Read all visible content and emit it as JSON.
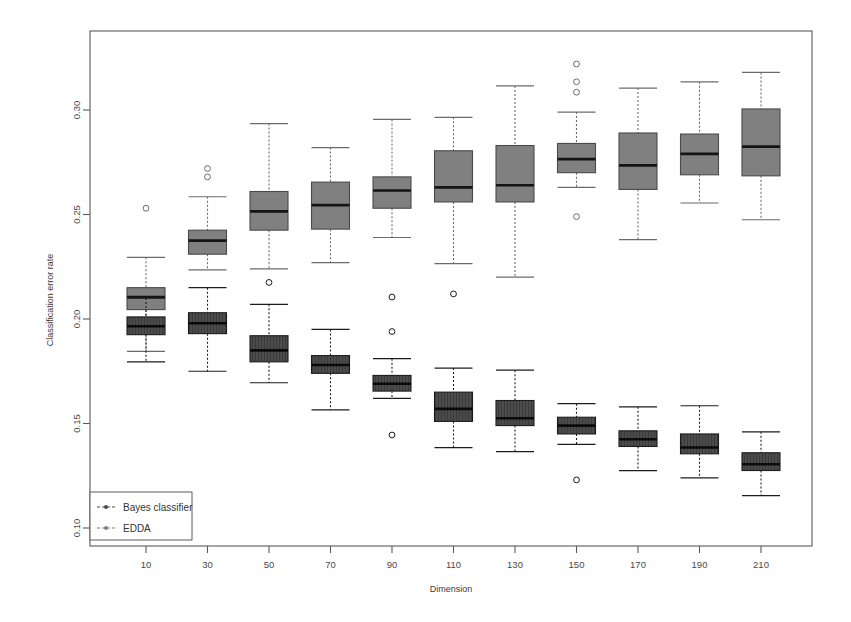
{
  "figure": {
    "width": 851,
    "height": 622,
    "background": "#ffffff"
  },
  "plot_frame": {
    "left": 90,
    "right": 812,
    "top": 31,
    "bottom": 546,
    "stroke": "#5a5a5a"
  },
  "axes": {
    "y_label": "Classification error rate",
    "x_label": "Dimension",
    "y_ticks": [
      {
        "value": 0.3,
        "label": "0.30"
      },
      {
        "value": 0.25,
        "label": "0.25"
      },
      {
        "value": 0.2,
        "label": "0.20"
      },
      {
        "value": 0.15,
        "label": "0.15"
      },
      {
        "value": 0.1,
        "label": "0.10"
      }
    ],
    "y_pixel_at_030": 110,
    "y_pixel_per_unit": 2090,
    "x_ticks": [
      "10",
      "30",
      "50",
      "70",
      "90",
      "110",
      "130",
      "150",
      "170",
      "190",
      "210"
    ],
    "x_first_center": 146,
    "x_spacing": 61.5,
    "grid": false
  },
  "legend": {
    "position": "bottom-left",
    "x": 90,
    "y": 492,
    "width": 102,
    "height": 48,
    "entries": [
      {
        "label": "Bayes classifier",
        "color": "#4c4c4c",
        "marker": "dashed-line-with-dot"
      },
      {
        "label": "EDDA",
        "color": "#808080",
        "marker": "dashed-line-with-dot"
      }
    ]
  },
  "series_style": {
    "bayes": {
      "name": "Bayes classifier",
      "fill": "#4c4c4c",
      "stroke": "#1c1c1c",
      "median_stroke": "#0a0a0a",
      "whisker_stroke": "#1c1c1c",
      "outlier_stroke": "#1c1c1c",
      "hatch": "vertical"
    },
    "edda": {
      "name": "EDDA",
      "fill": "#808080",
      "stroke": "#4a4a4a",
      "median_stroke": "#141414",
      "whisker_stroke": "#6b6b6b",
      "outlier_stroke": "#6b6b6b",
      "hatch": "none"
    }
  },
  "chart_data": {
    "type": "box",
    "title": "",
    "subtitle": "",
    "xlabel": "Dimension",
    "ylabel": "Classification error rate",
    "ylim": [
      0.095,
      0.327
    ],
    "categories": [
      10,
      30,
      50,
      70,
      90,
      110,
      130,
      150,
      170,
      190,
      210
    ],
    "legend": [
      "Bayes classifier",
      "EDDA"
    ],
    "legend_position": "bottom-left",
    "grid": false,
    "box_width_px": 38,
    "series": [
      {
        "name": "EDDA",
        "key": "edda",
        "color": "#808080",
        "boxes": [
          {
            "category": 10,
            "whisker_low": 0.1845,
            "q1": 0.2045,
            "median": 0.2105,
            "q3": 0.215,
            "whisker_high": 0.2295,
            "outliers": [
              0.253
            ]
          },
          {
            "category": 30,
            "whisker_low": 0.2235,
            "q1": 0.231,
            "median": 0.2375,
            "q3": 0.2425,
            "whisker_high": 0.2585,
            "outliers": [
              0.272,
              0.268
            ]
          },
          {
            "category": 50,
            "whisker_low": 0.224,
            "q1": 0.2425,
            "median": 0.2515,
            "q3": 0.261,
            "whisker_high": 0.2935,
            "outliers": []
          },
          {
            "category": 70,
            "whisker_low": 0.227,
            "q1": 0.243,
            "median": 0.2545,
            "q3": 0.2655,
            "whisker_high": 0.282,
            "outliers": []
          },
          {
            "category": 90,
            "whisker_low": 0.239,
            "q1": 0.253,
            "median": 0.2615,
            "q3": 0.268,
            "whisker_high": 0.2955,
            "outliers": []
          },
          {
            "category": 110,
            "whisker_low": 0.2265,
            "q1": 0.256,
            "median": 0.263,
            "q3": 0.2805,
            "whisker_high": 0.2965,
            "outliers": []
          },
          {
            "category": 130,
            "whisker_low": 0.22,
            "q1": 0.256,
            "median": 0.264,
            "q3": 0.283,
            "whisker_high": 0.3115,
            "outliers": []
          },
          {
            "category": 150,
            "whisker_low": 0.263,
            "q1": 0.27,
            "median": 0.2765,
            "q3": 0.284,
            "whisker_high": 0.299,
            "outliers": [
              0.322,
              0.3135,
              0.3085,
              0.249
            ]
          },
          {
            "category": 170,
            "whisker_low": 0.238,
            "q1": 0.262,
            "median": 0.2735,
            "q3": 0.289,
            "whisker_high": 0.3105,
            "outliers": []
          },
          {
            "category": 190,
            "whisker_low": 0.2555,
            "q1": 0.269,
            "median": 0.279,
            "q3": 0.2885,
            "whisker_high": 0.3135,
            "outliers": []
          },
          {
            "category": 210,
            "whisker_low": 0.2475,
            "q1": 0.2685,
            "median": 0.2825,
            "q3": 0.3005,
            "whisker_high": 0.318,
            "outliers": []
          }
        ]
      },
      {
        "name": "Bayes classifier",
        "key": "bayes",
        "color": "#4c4c4c",
        "boxes": [
          {
            "category": 10,
            "whisker_low": 0.1795,
            "q1": 0.1925,
            "median": 0.1965,
            "q3": 0.201,
            "whisker_high": 0.21,
            "outliers": []
          },
          {
            "category": 30,
            "whisker_low": 0.175,
            "q1": 0.193,
            "median": 0.198,
            "q3": 0.203,
            "whisker_high": 0.215,
            "outliers": []
          },
          {
            "category": 50,
            "whisker_low": 0.1695,
            "q1": 0.1795,
            "median": 0.185,
            "q3": 0.192,
            "whisker_high": 0.207,
            "outliers": [
              0.2175
            ]
          },
          {
            "category": 70,
            "whisker_low": 0.1565,
            "q1": 0.174,
            "median": 0.178,
            "q3": 0.1825,
            "whisker_high": 0.195,
            "outliers": []
          },
          {
            "category": 90,
            "whisker_low": 0.162,
            "q1": 0.1655,
            "median": 0.169,
            "q3": 0.173,
            "whisker_high": 0.181,
            "outliers": [
              0.2105,
              0.194,
              0.1445
            ]
          },
          {
            "category": 110,
            "whisker_low": 0.1385,
            "q1": 0.151,
            "median": 0.157,
            "q3": 0.165,
            "whisker_high": 0.1765,
            "outliers": [
              0.212
            ]
          },
          {
            "category": 130,
            "whisker_low": 0.1365,
            "q1": 0.149,
            "median": 0.1525,
            "q3": 0.161,
            "whisker_high": 0.1755,
            "outliers": []
          },
          {
            "category": 150,
            "whisker_low": 0.14,
            "q1": 0.145,
            "median": 0.149,
            "q3": 0.153,
            "whisker_high": 0.1595,
            "outliers": [
              0.123
            ]
          },
          {
            "category": 170,
            "whisker_low": 0.1275,
            "q1": 0.139,
            "median": 0.1425,
            "q3": 0.1465,
            "whisker_high": 0.158,
            "outliers": []
          },
          {
            "category": 190,
            "whisker_low": 0.124,
            "q1": 0.1355,
            "median": 0.1385,
            "q3": 0.145,
            "whisker_high": 0.1585,
            "outliers": []
          },
          {
            "category": 210,
            "whisker_low": 0.1155,
            "q1": 0.1275,
            "median": 0.1305,
            "q3": 0.136,
            "whisker_high": 0.146,
            "outliers": []
          }
        ]
      }
    ]
  }
}
